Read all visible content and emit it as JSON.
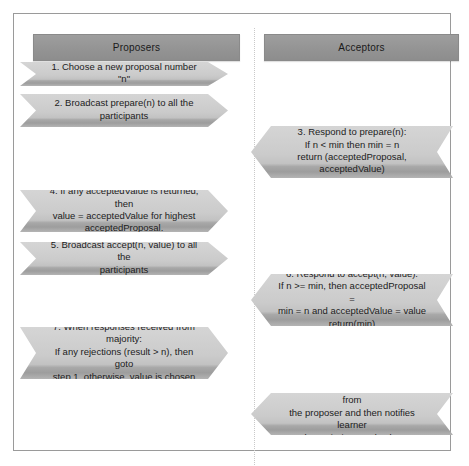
{
  "diagram": {
    "columns": [
      {
        "id": "proposers",
        "label": "Proposers"
      },
      {
        "id": "acceptors",
        "label": "Acceptors"
      }
    ],
    "colors": {
      "header_fill": "#969696",
      "arrow_fill": "#c8c8c8",
      "arrow_shadow": "#9d9d9d",
      "frame_border": "#9a9a9a",
      "divider": "#c9c9c9",
      "text": "#1c1c1c"
    },
    "steps": [
      {
        "number": "1",
        "column": "proposers",
        "direction": "right",
        "lines": [
          "1. Choose a new proposal number \"n\""
        ]
      },
      {
        "number": "2",
        "column": "proposers",
        "direction": "right",
        "lines": [
          "2. Broadcast prepare(n) to all the",
          "participants"
        ]
      },
      {
        "number": "3",
        "column": "acceptors",
        "direction": "left",
        "lines": [
          "3. Respond to prepare(n):",
          "If n < min then min = n",
          "return (acceptedProposal,",
          "acceptedValue)"
        ]
      },
      {
        "number": "4",
        "column": "proposers",
        "direction": "right",
        "lines": [
          "4. If any acceptedValue is returned, then",
          "value = acceptedValue for highest",
          "acceptedProposal."
        ]
      },
      {
        "number": "5",
        "column": "proposers",
        "direction": "right",
        "lines": [
          "5. Broadcast accept(n, value) to all the",
          "participants"
        ]
      },
      {
        "number": "6",
        "column": "acceptors",
        "direction": "left",
        "lines": [
          "6. Respond to accept(n, value):",
          "If n >= min, then acceptedProposal =",
          "min = n and acceptedValue = value",
          "return(min)"
        ]
      },
      {
        "number": "7",
        "column": "proposers",
        "direction": "right",
        "lines": [
          "7. When responses received from",
          "majority:",
          "If any rejections (result > n), then goto",
          "step 1, otherwise, value is chosen"
        ]
      },
      {
        "number": "8",
        "column": "acceptors",
        "direction": "left",
        "lines": [
          "8. Each acceptor accepts value from",
          "the proposer and then notifies learner",
          "the majority voted value"
        ]
      }
    ]
  }
}
